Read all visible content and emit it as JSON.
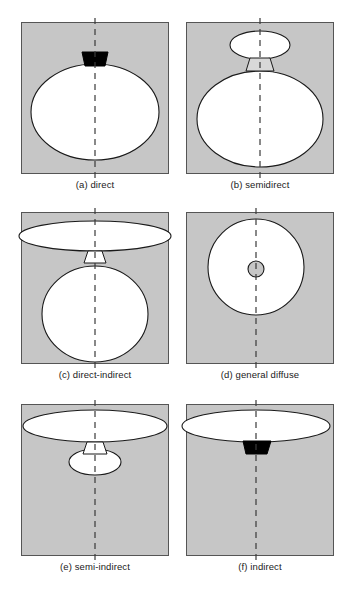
{
  "figure": {
    "name": "lighting-distribution-classification",
    "background_color": "#ffffff",
    "panel_fill_color": "#c6c6c6",
    "panel_border_color": "#555555",
    "shape_fill_color": "#ffffff",
    "shape_stroke_color": "#1a1a1a",
    "lamp_color": "#000000",
    "axis_style": "vertical-dashed-centerline",
    "axis_color": "#3a3a3a",
    "rows": 3,
    "columns": 2
  },
  "panels": [
    {
      "id": "a",
      "caption": "(a) direct",
      "label": "a",
      "name": "direct",
      "elements": [
        "black-lamp-housing",
        "large-ellipse-downward",
        "center-dashed-axis"
      ],
      "distribution": "downward"
    },
    {
      "id": "b",
      "caption": "(b) semidirect",
      "label": "b",
      "name": "semidirect",
      "elements": [
        "small-upper-ellipse",
        "trapezoid-connector",
        "large-lower-ellipse",
        "center-dashed-axis"
      ],
      "distribution": "mostly-downward"
    },
    {
      "id": "c",
      "caption": "(c) direct-indirect",
      "label": "c",
      "name": "direct-indirect",
      "elements": [
        "wide-flat-upper-ellipse",
        "trapezoid-connector",
        "large-lower-circle",
        "center-dashed-axis"
      ],
      "distribution": "up-and-down"
    },
    {
      "id": "d",
      "caption": "(d) general diffuse",
      "label": "d",
      "name": "general-diffuse",
      "elements": [
        "large-circle",
        "small-center-circle",
        "center-dashed-axis"
      ],
      "distribution": "all-directions"
    },
    {
      "id": "e",
      "caption": "(e) semi-indirect",
      "label": "e",
      "name": "semi-indirect",
      "elements": [
        "wide-flat-upper-ellipse",
        "trapezoid-connector",
        "small-lower-ellipse",
        "center-dashed-axis"
      ],
      "distribution": "mostly-upward"
    },
    {
      "id": "f",
      "caption": "(f) indirect",
      "label": "f",
      "name": "indirect",
      "elements": [
        "wide-flat-upper-ellipse",
        "black-lamp-housing",
        "center-dashed-axis"
      ],
      "distribution": "upward"
    }
  ]
}
